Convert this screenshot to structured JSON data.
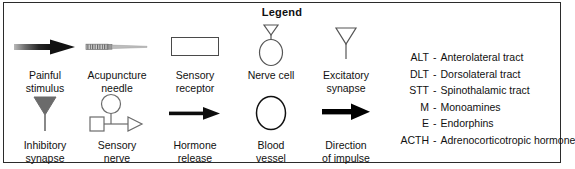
{
  "legend": {
    "title": "Legend",
    "border_color": "#2b2b2b",
    "background": "#ffffff",
    "text_color": "#111111"
  },
  "symbols": {
    "row_top": [
      {
        "icon": "gradient-arrow-icon",
        "label": "Painful\nstimulus",
        "color": "#1a1a1a"
      },
      {
        "icon": "acupuncture-needle-icon",
        "label": "Acupuncture\nneedle",
        "color": "#6e6e6e"
      },
      {
        "icon": "rectangle-receptor-icon",
        "label": "Sensory\nreceptor",
        "color": "#4a4a4a"
      },
      {
        "icon": "nerve-cell-icon",
        "label": "Nerve cell",
        "color": "#555555"
      },
      {
        "icon": "excitatory-synapse-icon",
        "label": "Excitatory\nsynapse",
        "color": "#555555"
      }
    ],
    "row_bottom": [
      {
        "icon": "inhibitory-synapse-icon",
        "label": "Inhibitory\nsynapse",
        "color": "#6b6b6b"
      },
      {
        "icon": "sensory-nerve-icon",
        "label": "Sensory\nnerve",
        "color": "#6b6b6b"
      },
      {
        "icon": "hormone-release-arrow-icon",
        "label": "Hormone\nrelease",
        "color": "#0d0d0d"
      },
      {
        "icon": "blood-vessel-icon",
        "label": "Blood\nvessel",
        "color": "#111111"
      },
      {
        "icon": "direction-of-impulse-arrow-icon",
        "label": "Direction\nof impulse",
        "color": "#000000"
      }
    ]
  },
  "abbreviations": [
    {
      "key": "ALT",
      "dash": "-",
      "value": "Anterolateral tract"
    },
    {
      "key": "DLT",
      "dash": "-",
      "value": "Dorsolateral tract"
    },
    {
      "key": "STT",
      "dash": "-",
      "value": "Spinothalamic tract"
    },
    {
      "key": "M",
      "dash": "-",
      "value": "Monoamines"
    },
    {
      "key": "E",
      "dash": "-",
      "value": "Endorphins"
    },
    {
      "key": "ACTH",
      "dash": "-",
      "value": "Adrenocorticotropic hormone"
    }
  ]
}
